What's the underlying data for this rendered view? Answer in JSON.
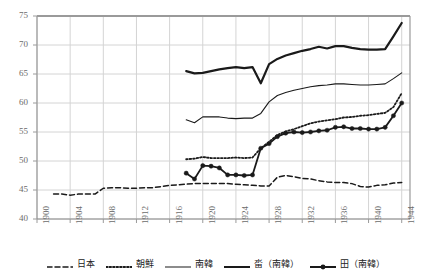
{
  "chart_data": {
    "type": "line",
    "title": "",
    "xlabel": "",
    "ylabel": "",
    "xlim": [
      1900,
      1945
    ],
    "ylim": [
      40,
      75
    ],
    "xticks": [
      "1900",
      "1904",
      "1908",
      "1912",
      "1916",
      "1920",
      "1924",
      "1928",
      "1932",
      "1936",
      "1940",
      "1944"
    ],
    "yticks": [
      "40",
      "45",
      "50",
      "55",
      "60",
      "65",
      "70",
      "75"
    ],
    "grid": true,
    "legend_position": "bottom",
    "series": [
      {
        "name": "日本",
        "style": "dashed",
        "color": "#1a1a1a",
        "markers": false,
        "x": [
          1902,
          1903,
          1904,
          1905,
          1906,
          1907,
          1908,
          1909,
          1910,
          1911,
          1912,
          1913,
          1914,
          1915,
          1916,
          1917,
          1918,
          1919,
          1920,
          1921,
          1922,
          1923,
          1924,
          1925,
          1926,
          1927,
          1928,
          1929,
          1930,
          1931,
          1932,
          1933,
          1934,
          1935,
          1936,
          1937,
          1938,
          1939,
          1940,
          1941,
          1942,
          1943,
          1944
        ],
        "values": [
          44.3,
          44.3,
          44.1,
          44.3,
          44.3,
          44.3,
          45.3,
          45.4,
          45.4,
          45.3,
          45.3,
          45.4,
          45.4,
          45.6,
          45.8,
          45.9,
          46.0,
          46.1,
          46.1,
          46.1,
          46.1,
          46.1,
          46.0,
          45.9,
          45.8,
          45.7,
          45.7,
          47.2,
          47.5,
          47.3,
          47.0,
          46.9,
          46.6,
          46.4,
          46.3,
          46.3,
          46.1,
          45.6,
          45.5,
          45.8,
          45.9,
          46.2,
          46.3
        ]
      },
      {
        "name": "朝鮮",
        "style": "dotted",
        "color": "#1a1a1a",
        "markers": false,
        "x": [
          1918,
          1919,
          1920,
          1921,
          1922,
          1923,
          1924,
          1925,
          1926,
          1927,
          1928,
          1929,
          1930,
          1931,
          1932,
          1933,
          1934,
          1935,
          1936,
          1937,
          1938,
          1939,
          1940,
          1941,
          1942,
          1943,
          1944
        ],
        "values": [
          50.3,
          50.4,
          50.7,
          50.5,
          50.5,
          50.5,
          50.6,
          50.5,
          50.6,
          52.2,
          53.3,
          54.5,
          55.1,
          55.5,
          56.0,
          56.5,
          56.8,
          57.0,
          57.2,
          57.5,
          57.6,
          57.8,
          57.9,
          58.1,
          58.3,
          59.3,
          61.7
        ]
      },
      {
        "name": "南韓",
        "style": "solid-thin",
        "color": "#1a1a1a",
        "markers": false,
        "x": [
          1918,
          1919,
          1920,
          1921,
          1922,
          1923,
          1924,
          1925,
          1926,
          1927,
          1928,
          1929,
          1930,
          1931,
          1932,
          1933,
          1934,
          1935,
          1936,
          1937,
          1938,
          1939,
          1940,
          1941,
          1942,
          1943,
          1944
        ],
        "values": [
          57.1,
          56.6,
          57.6,
          57.6,
          57.6,
          57.4,
          57.3,
          57.4,
          57.4,
          58.2,
          60.2,
          61.3,
          61.8,
          62.2,
          62.5,
          62.8,
          63.0,
          63.1,
          63.3,
          63.3,
          63.2,
          63.1,
          63.1,
          63.2,
          63.3,
          64.2,
          65.2
        ]
      },
      {
        "name": "畓（南韓）",
        "style": "solid-thick",
        "color": "#1a1a1a",
        "markers": false,
        "x": [
          1918,
          1919,
          1920,
          1921,
          1922,
          1923,
          1924,
          1925,
          1926,
          1927,
          1928,
          1929,
          1930,
          1931,
          1932,
          1933,
          1934,
          1935,
          1936,
          1937,
          1938,
          1939,
          1940,
          1941,
          1942,
          1943,
          1944
        ],
        "values": [
          65.5,
          65.1,
          65.2,
          65.5,
          65.8,
          66.0,
          66.2,
          66.0,
          66.2,
          63.4,
          66.7,
          67.6,
          68.2,
          68.6,
          69.0,
          69.3,
          69.7,
          69.4,
          69.8,
          69.8,
          69.5,
          69.3,
          69.2,
          69.2,
          69.3,
          71.5,
          73.8
        ]
      },
      {
        "name": "田（南韓）",
        "style": "solid-marker",
        "color": "#1a1a1a",
        "markers": true,
        "x": [
          1918,
          1919,
          1920,
          1921,
          1922,
          1923,
          1924,
          1925,
          1926,
          1927,
          1928,
          1929,
          1930,
          1931,
          1932,
          1933,
          1934,
          1935,
          1936,
          1937,
          1938,
          1939,
          1940,
          1941,
          1942,
          1943,
          1944
        ],
        "values": [
          47.9,
          46.9,
          49.2,
          49.1,
          48.8,
          47.6,
          47.6,
          47.5,
          47.6,
          52.2,
          53.0,
          54.2,
          54.8,
          55.0,
          54.9,
          55.0,
          55.2,
          55.3,
          55.8,
          55.9,
          55.6,
          55.6,
          55.5,
          55.5,
          55.8,
          57.8,
          60.0
        ]
      }
    ]
  },
  "legend": {
    "items": [
      {
        "label": "日本",
        "style": "dashed"
      },
      {
        "label": "朝鮮",
        "style": "dotted"
      },
      {
        "label": "南韓",
        "style": "solid-thin"
      },
      {
        "label": "畓（南韓）",
        "style": "solid-thick"
      },
      {
        "label": "田（南韓）",
        "style": "solid-marker"
      }
    ]
  }
}
